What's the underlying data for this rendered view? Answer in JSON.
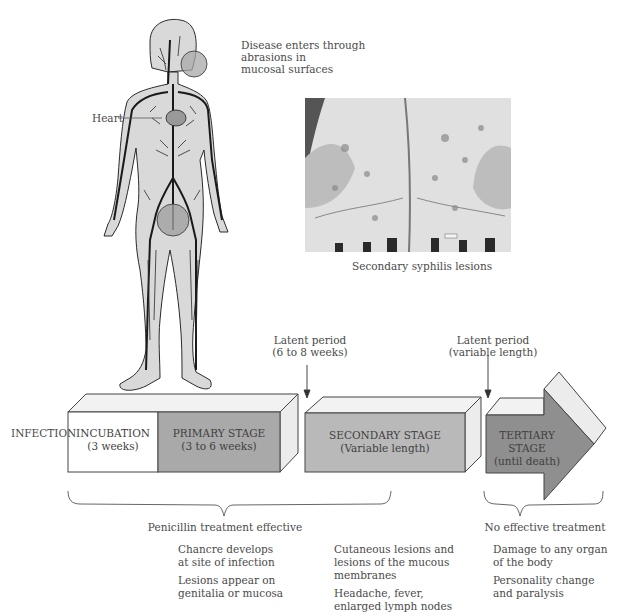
{
  "figure": {
    "body_diagram": {
      "label_heart": "Heart",
      "entry_note": [
        "Disease enters through",
        "abrasions in",
        "mucosal surfaces"
      ]
    },
    "photo": {
      "caption": "Secondary syphilis lesions"
    },
    "timeline": {
      "start_label": "INFECTION",
      "latent_periods": [
        {
          "line1": "Latent period",
          "line2": "(6 to 8 weeks)"
        },
        {
          "line1": "Latent period",
          "line2": "(variable length)"
        }
      ],
      "stages": [
        {
          "name": "INCUBATION",
          "duration": "(3 weeks)",
          "color": "#ffffff"
        },
        {
          "name": "PRIMARY STAGE",
          "duration": "(3 to 6 weeks)",
          "color": "#a9a9a9"
        },
        {
          "name": "SECONDARY STAGE",
          "duration": "(Variable length)",
          "color": "#b9b9b9"
        },
        {
          "name": "TERTIARY STAGE",
          "duration": "(until death)",
          "color": "#8f8f8f"
        }
      ]
    },
    "treatment": {
      "effective_label": "Penicillin treatment effective",
      "not_effective_label": "No effective treatment"
    },
    "symptoms": {
      "primary": [
        {
          "line1": "Chancre develops",
          "line2": "at site of infection"
        },
        {
          "line1": "Lesions appear on",
          "line2": "genitalia or mucosa"
        }
      ],
      "secondary": [
        {
          "line1": "Cutaneous lesions and",
          "line2": "lesions of the mucous",
          "line3": "membranes"
        },
        {
          "line1": "Headache, fever,",
          "line2": "enlarged lymph nodes"
        }
      ],
      "tertiary": [
        {
          "line1": "Damage to any organ",
          "line2": "of the body"
        },
        {
          "line1": "Personality change",
          "line2": "and paralysis"
        }
      ]
    }
  }
}
